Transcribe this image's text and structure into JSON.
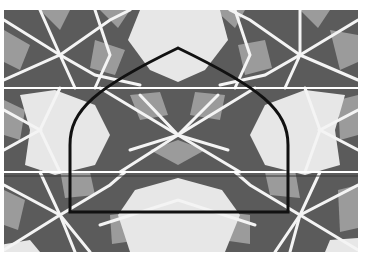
{
  "figure": {
    "kind": "geometric-tiling-illustration",
    "clipped_caption_text": "",
    "colors": {
      "background": "#ffffff",
      "light_tile": "#e7e7e7",
      "mid_tile": "#9b9b9b",
      "dark_tile": "#5b5b5b",
      "interlace_line": "#f4f4f4",
      "arch_outline": "#111111",
      "thin_rule": "#3a3a3a"
    },
    "pattern_bounds": {
      "x": 4,
      "y": 10,
      "width": 354,
      "height": 242
    },
    "strip_seams_y": [
      88,
      172
    ],
    "arch": {
      "left_x": 70,
      "right_x": 288,
      "bottom_y": 212,
      "apex": {
        "x": 178,
        "y": 48
      },
      "shoulder_y": 140,
      "stroke_width": 3
    },
    "thin_rule_y": 176
  }
}
